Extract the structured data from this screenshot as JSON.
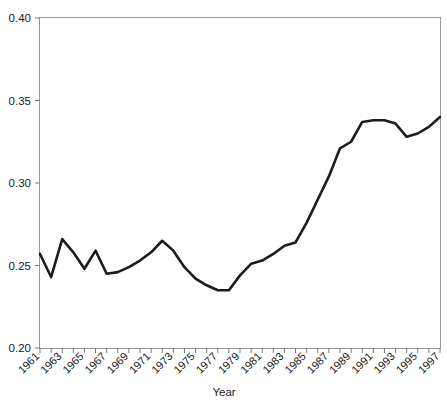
{
  "chart_data": {
    "type": "line",
    "title": "",
    "subtitle": "",
    "xlabel": "Year",
    "ylabel": "",
    "xlim": [
      1961,
      1997
    ],
    "ylim": [
      0.2,
      0.4
    ],
    "grid": false,
    "legend": null,
    "legend_position": "none",
    "y_ticks": [
      0.2,
      0.25,
      0.3,
      0.35,
      0.4
    ],
    "y_tick_labels": [
      "0.20",
      "0.25",
      "0.30",
      "0.35",
      "0.40"
    ],
    "x_tick_labels": [
      "1961",
      "1963",
      "1965",
      "1967",
      "1969",
      "1971",
      "1973",
      "1975",
      "1977",
      "1979",
      "1981",
      "1983",
      "1985",
      "1987",
      "1989",
      "1991",
      "1993",
      "1995",
      "1997"
    ],
    "x_tick_label_rotation": 45,
    "x_minor_ticks_every": 1,
    "line_color": "#1c1c1c",
    "line_width": 2.6,
    "frame_color": "#9a9a9a",
    "x": [
      1961,
      1962,
      1963,
      1964,
      1965,
      1966,
      1967,
      1968,
      1969,
      1970,
      1971,
      1972,
      1973,
      1974,
      1975,
      1976,
      1977,
      1978,
      1979,
      1980,
      1981,
      1982,
      1983,
      1984,
      1985,
      1986,
      1987,
      1988,
      1989,
      1990,
      1991,
      1992,
      1993,
      1994,
      1995,
      1996,
      1997
    ],
    "values": [
      0.257,
      0.243,
      0.266,
      0.258,
      0.248,
      0.259,
      0.245,
      0.246,
      0.249,
      0.253,
      0.258,
      0.265,
      0.259,
      0.249,
      0.242,
      0.238,
      0.235,
      0.235,
      0.244,
      0.251,
      0.253,
      0.257,
      0.262,
      0.264,
      0.276,
      0.29,
      0.304,
      0.321,
      0.325,
      0.337,
      0.338,
      0.338,
      0.336,
      0.328,
      0.33,
      0.334,
      0.34
    ]
  },
  "axis": {
    "x_title": "Year"
  }
}
